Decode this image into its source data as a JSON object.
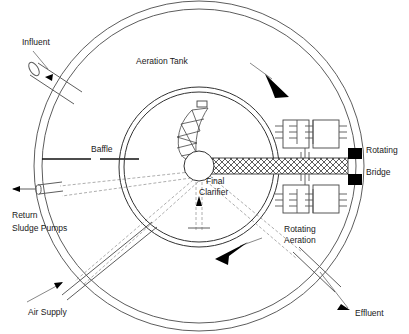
{
  "diagram": {
    "type": "process-flow-schematic",
    "labels": {
      "influent": "Influent",
      "aeration_tank": "Aeration Tank",
      "baffle": "Baffle",
      "final_clarifier_line1": "Final",
      "final_clarifier_line2": "Clarifier",
      "rotating_bridge_line1": "Rotating",
      "rotating_bridge_line2": "Bridge",
      "rotating_aeration_line1": "Rotating",
      "rotating_aeration_line2": "Aeration",
      "return_sludge_line1": "Return",
      "return_sludge_line2": "Sludge Pumps",
      "air_supply": "Air Supply",
      "effluent": "Effluent"
    },
    "components": [
      {
        "name": "outer-tank-wall",
        "shape": "double-circle",
        "cx": 199,
        "cy": 166,
        "r_outer": 166,
        "r_inner": 158
      },
      {
        "name": "final-clarifier-wall",
        "shape": "double-circle",
        "cx": 199,
        "cy": 167,
        "r_outer": 80,
        "r_inner": 75
      },
      {
        "name": "center-hub",
        "shape": "circle",
        "cx": 199,
        "cy": 166,
        "r": 15
      },
      {
        "name": "rotating-bridge",
        "shape": "hatched-bar"
      },
      {
        "name": "helical-scraper",
        "shape": "spiral-flight"
      },
      {
        "name": "aerator-upper",
        "shape": "double-box-with-diffusers"
      },
      {
        "name": "aerator-lower",
        "shape": "double-box-with-diffusers"
      },
      {
        "name": "bridge-end-block-upper",
        "shape": "filled-square"
      },
      {
        "name": "bridge-end-block-lower",
        "shape": "filled-square"
      },
      {
        "name": "influent-pipe",
        "shape": "cylinder"
      },
      {
        "name": "return-sludge-pipe",
        "shape": "cylinder"
      },
      {
        "name": "air-supply-pipe",
        "shape": "double-line"
      },
      {
        "name": "effluent-pipe",
        "shape": "double-line"
      },
      {
        "name": "rotation-arrow-upper",
        "direction": "down-right"
      },
      {
        "name": "rotation-arrow-lower",
        "direction": "down-left"
      },
      {
        "name": "sludge-flow-arrow",
        "direction": "up"
      }
    ],
    "colors": {
      "stroke": "#5d5d5d",
      "dark_stroke": "#1a1a1a",
      "fill_black": "#000000",
      "background": "#ffffff",
      "dashed_pipe": "#999999"
    }
  }
}
